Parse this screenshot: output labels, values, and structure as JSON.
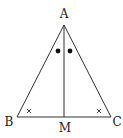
{
  "diagram": {
    "type": "geometry-triangle",
    "points": {
      "A": {
        "label": "A",
        "x": 64,
        "y": 25,
        "label_x": 64,
        "label_y": 18
      },
      "B": {
        "label": "B",
        "x": 17,
        "y": 117,
        "label_x": 9,
        "label_y": 126
      },
      "C": {
        "label": "C",
        "x": 111,
        "y": 117,
        "label_x": 117,
        "label_y": 126
      },
      "M": {
        "label": "M",
        "x": 64,
        "y": 117,
        "label_x": 65,
        "label_y": 132
      }
    },
    "segments": [
      "AB",
      "AC",
      "BC",
      "AM"
    ],
    "angle_marks": {
      "bisector_dots": [
        {
          "x": 58,
          "y": 51
        },
        {
          "x": 70,
          "y": 51
        }
      ],
      "equal_angle_crosses": [
        {
          "x": 29,
          "y": 111,
          "vertex": "B"
        },
        {
          "x": 99,
          "y": 111,
          "vertex": "C"
        }
      ]
    },
    "colors": {
      "line": "#333333",
      "text": "#222222",
      "background": "#ffffff"
    }
  }
}
